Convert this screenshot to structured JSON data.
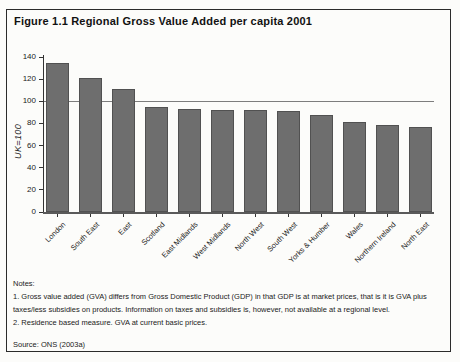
{
  "figure": {
    "title": "Figure 1.1 Regional Gross Value Added per capita 2001"
  },
  "chart_data": {
    "type": "bar",
    "title": "Figure 1.1 Regional Gross Value Added per capita 2001",
    "categories": [
      "London",
      "South East",
      "East",
      "Scotland",
      "East Midlands",
      "West Midlands",
      "North West",
      "South West",
      "Yorks & Humber",
      "Wales",
      "Northern Ireland",
      "North East"
    ],
    "values": [
      135,
      121,
      111,
      95,
      93,
      92,
      92,
      91,
      88,
      81,
      79,
      77
    ],
    "xlabel": "",
    "ylabel": "UK=100",
    "ylim": [
      0,
      140
    ],
    "ytick_step": 20,
    "reference_line": 100,
    "bar_color": "#6e6e6e",
    "grid": false,
    "legend": "none"
  },
  "notes": {
    "heading": "Notes:",
    "note1": "1. Gross value added (GVA) differs from Gross Domestic Product (GDP) in that GDP is at market prices, that is it is GVA plus taxes/less subsidies on products. Information on taxes and subsidies is, however, not available at a regional level.",
    "note2": "2. Residence based measure. GVA at current basic prices.",
    "source": "Source: ONS (2003a)"
  }
}
